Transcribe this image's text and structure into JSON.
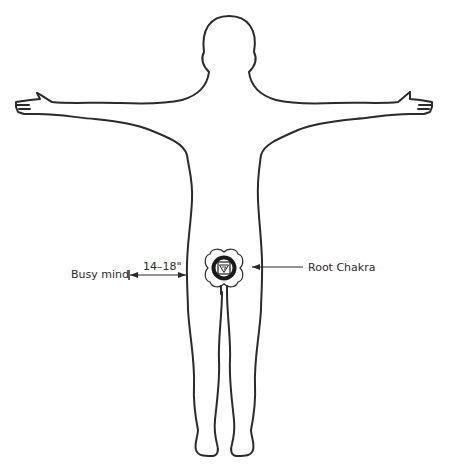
{
  "diagram": {
    "type": "human-body-outline",
    "pose": "standing, arms outstretched horizontally",
    "colors": {
      "line": "#2a2a2a",
      "background": "#ffffff",
      "chakra_fill": "#1a1a1a"
    },
    "labels": {
      "left_label": "Busy mind",
      "distance": "14–18\"",
      "right_label": "Root Chakra"
    },
    "icons": {
      "chakra_symbol": "root-chakra-lotus-icon"
    }
  }
}
